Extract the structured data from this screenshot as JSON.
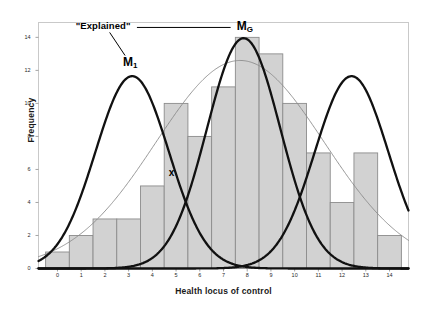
{
  "chart_data": {
    "type": "bar",
    "title": "",
    "subtitle": "",
    "xlabel": "Health locus of control",
    "ylabel": "Frequency",
    "categories": [
      "0",
      "1",
      "2",
      "3",
      "4",
      "5",
      "6",
      "7",
      "8",
      "9",
      "10",
      "11",
      "12",
      "13",
      "14"
    ],
    "values": [
      1,
      2,
      3,
      3,
      5,
      10,
      8,
      11,
      14,
      13,
      10,
      7,
      4,
      7,
      2
    ],
    "xlim": [
      -0.8,
      14.8
    ],
    "ylim": [
      0,
      14.9
    ],
    "xticks": [
      "0",
      "1",
      "2",
      "3",
      "4",
      "5",
      "6",
      "7",
      "8",
      "9",
      "10",
      "11",
      "12",
      "13",
      "14"
    ],
    "yticks": [
      "0",
      "2",
      "4",
      "6",
      "8",
      "10",
      "12",
      "14"
    ],
    "grid": false,
    "legend_position": "none",
    "bar_fill_color": "#d2d2d2",
    "bar_edge_color": "#8c8c8c",
    "series": [
      {
        "name": "overall-normal-curve",
        "type": "line",
        "style": "thin-gray",
        "color": "#8a8a8a",
        "mean": 7.7,
        "sd": 3.55,
        "peak_value": 12.6
      },
      {
        "name": "component-curve-M1",
        "type": "line",
        "style": "thick-black",
        "color": "#111111",
        "mean": 3.15,
        "sd": 1.55,
        "peak_value": 11.65
      },
      {
        "name": "component-curve-MG",
        "type": "line",
        "style": "thick-black",
        "color": "#111111",
        "mean": 7.85,
        "sd": 1.55,
        "peak_value": 13.95
      },
      {
        "name": "component-curve-right",
        "type": "line",
        "style": "thick-black",
        "color": "#111111",
        "mean": 12.4,
        "sd": 1.55,
        "peak_value": 11.65
      }
    ],
    "annotations": [
      {
        "name": "explained-label",
        "text": "\"Explained\"",
        "x": 2.2,
        "y": 14.6
      },
      {
        "name": "m1-label",
        "text": "M",
        "sub": "1",
        "x": 3.1,
        "y": 12.45
      },
      {
        "name": "mg-label",
        "text": "M",
        "sub": "G",
        "x": 7.9,
        "y": 14.55
      },
      {
        "name": "x-marker",
        "text": "x",
        "x": 4.82,
        "y": 5.72
      },
      {
        "name": "explained-connector",
        "from_x": 3.35,
        "from_y": 14.6,
        "to_x": 7.3,
        "to_y": 14.6
      },
      {
        "name": "explained-leader",
        "from_x": 2.2,
        "from_y": 14.3,
        "to_x": 2.85,
        "to_y": 12.9
      }
    ]
  }
}
